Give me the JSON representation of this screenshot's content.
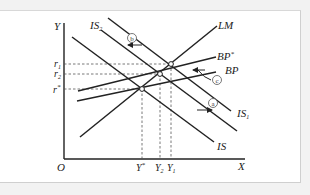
{
  "diagram": {
    "axes": {
      "y_label": "Y",
      "x_label": "X",
      "origin_label": "O"
    },
    "y_ticks": [
      {
        "label": "r",
        "sub": "1"
      },
      {
        "label": "r",
        "sub": "2"
      },
      {
        "label": "r",
        "sub": "*"
      }
    ],
    "x_ticks": [
      {
        "label": "Y",
        "sub": "*"
      },
      {
        "label": "Y",
        "sub": "2"
      },
      {
        "label": "Y",
        "sub": "1"
      }
    ],
    "curves": {
      "lm": "LM",
      "bp_star": "BP",
      "bp_star_sup": "*",
      "bp": "BP",
      "is": "IS",
      "is1": "IS",
      "is1_sub": "1",
      "is2": "IS",
      "is2_sub": "2"
    },
    "markers": {
      "a": "a",
      "b": "b",
      "c": "c"
    },
    "colors": {
      "line": "#222222",
      "dashed": "#555555",
      "background": "#ffffff"
    }
  }
}
